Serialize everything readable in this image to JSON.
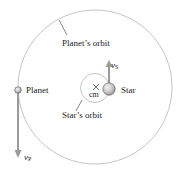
{
  "diagram": {
    "labels": {
      "planets_orbit": "Planet’s orbit",
      "stars_orbit": "Star’s orbit",
      "planet": "Planet",
      "star": "Star",
      "center_of_mass": "cm",
      "center_of_mass_marker": "×",
      "planet_velocity_symbol": "v",
      "planet_velocity_subscript": "P",
      "star_velocity_symbol": "v",
      "star_velocity_subscript": "S"
    },
    "colors": {
      "orbit_line": "#b0b0b0",
      "arrow": "#9a9a9a",
      "body_fill": "#c8c8c8",
      "text": "#1a1a1a"
    }
  }
}
